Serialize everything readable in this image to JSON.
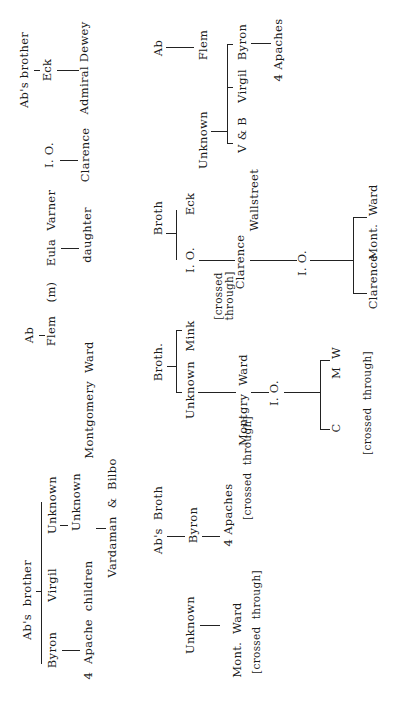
{
  "diagram": {
    "orientation": "page rotated 90deg counter-clockwise; text reads bottom-to-top",
    "type": "genealogy-tree",
    "labels": [
      {
        "id": "abs-brother-top",
        "text": "Ab's brother",
        "x": 25,
        "y": 70
      },
      {
        "id": "eck-top",
        "text": "Eck",
        "x": 48,
        "y": 70
      },
      {
        "id": "admiral-dewey",
        "text": "Admiral Dewey",
        "x": 85,
        "y": 68
      },
      {
        "id": "io-top",
        "text": "I. O.",
        "x": 50,
        "y": 155
      },
      {
        "id": "clarence-top",
        "text": "Clarence",
        "x": 86,
        "y": 155
      },
      {
        "id": "ab-top",
        "text": "Ab",
        "x": 159,
        "y": 48
      },
      {
        "id": "flem-top",
        "text": "Flem",
        "x": 204,
        "y": 45
      },
      {
        "id": "byron-top",
        "text": "Byron",
        "x": 243,
        "y": 42
      },
      {
        "id": "four-apaches-top",
        "text": "4 Apaches",
        "x": 279,
        "y": 50
      },
      {
        "id": "virgil-top",
        "text": "Virgil",
        "x": 243,
        "y": 86
      },
      {
        "id": "unknown-top",
        "text": "Unknown",
        "x": 204,
        "y": 140
      },
      {
        "id": "v-and-b",
        "text": "V & B",
        "x": 243,
        "y": 135
      },
      {
        "id": "wallstreet",
        "text": "Wallstreet",
        "x": 255,
        "y": 200
      },
      {
        "id": "eula-varner",
        "text": "Eula  Varner",
        "x": 52,
        "y": 228
      },
      {
        "id": "m-marker",
        "text": "(m)",
        "x": 52,
        "y": 292
      },
      {
        "id": "daughter",
        "text": "daughter",
        "x": 88,
        "y": 235
      },
      {
        "id": "broth-1",
        "text": "Broth",
        "x": 159,
        "y": 218
      },
      {
        "id": "eck-mid",
        "text": "Eck",
        "x": 191,
        "y": 204
      },
      {
        "id": "io-mid",
        "text": "I. O.",
        "x": 191,
        "y": 260
      },
      {
        "id": "crossed-through-1",
        "text": "[crossed\nthrough]",
        "x": 223,
        "y": 296
      },
      {
        "id": "clarence-mid",
        "text": "Clarence",
        "x": 241,
        "y": 262
      },
      {
        "id": "io-right",
        "text": "I. O.",
        "x": 303,
        "y": 263
      },
      {
        "id": "mont-ward-right",
        "text": "Mont.  Ward",
        "x": 374,
        "y": 222
      },
      {
        "id": "clarence-right",
        "text": "Clarence",
        "x": 374,
        "y": 282
      },
      {
        "id": "ab-left",
        "text": "Ab",
        "x": 30,
        "y": 335
      },
      {
        "id": "flem-left",
        "text": "Flem",
        "x": 52,
        "y": 331
      },
      {
        "id": "montgomery-ward",
        "text": "Montgomery  Ward",
        "x": 90,
        "y": 400
      },
      {
        "id": "broth-2",
        "text": "Broth.",
        "x": 159,
        "y": 362
      },
      {
        "id": "mink",
        "text": "Mink",
        "x": 191,
        "y": 336
      },
      {
        "id": "unknown-mid",
        "text": "Unknown",
        "x": 191,
        "y": 390
      },
      {
        "id": "montgry-ward",
        "text": "Montgry  Ward",
        "x": 244,
        "y": 400
      },
      {
        "id": "io-low",
        "text": "I. O.",
        "x": 275,
        "y": 393
      },
      {
        "id": "m-w",
        "text": "M  W",
        "x": 337,
        "y": 363
      },
      {
        "id": "c-label",
        "text": "C",
        "x": 337,
        "y": 428
      },
      {
        "id": "crossed-through-2",
        "text": "[crossed  through]",
        "x": 367,
        "y": 403
      },
      {
        "id": "abs-brother-left",
        "text": "Ab's  brother",
        "x": 28,
        "y": 600
      },
      {
        "id": "unknown-left-1",
        "text": "Unknown",
        "x": 53,
        "y": 505
      },
      {
        "id": "unknown-left-2",
        "text": "Unknown",
        "x": 77,
        "y": 502
      },
      {
        "id": "vardaman-bilbo",
        "text": "Vardaman  &  Bilbo",
        "x": 113,
        "y": 518
      },
      {
        "id": "virgil-left",
        "text": "Virgil",
        "x": 53,
        "y": 585
      },
      {
        "id": "byron-left",
        "text": "Byron",
        "x": 53,
        "y": 650
      },
      {
        "id": "four-apache-children",
        "text": "4  Apache  children",
        "x": 89,
        "y": 620
      },
      {
        "id": "abs-broth",
        "text": "Ab's  Broth",
        "x": 159,
        "y": 520
      },
      {
        "id": "byron-mid",
        "text": "Byron",
        "x": 194,
        "y": 525
      },
      {
        "id": "four-apaches-mid",
        "text": "4 Apaches",
        "x": 229,
        "y": 515
      },
      {
        "id": "crossed-through-3",
        "text": "[crossed  through]",
        "x": 247,
        "y": 468
      },
      {
        "id": "unknown-bottom",
        "text": "Unknown",
        "x": 191,
        "y": 625
      },
      {
        "id": "mont-ward-bottom",
        "text": "Mont.  Ward",
        "x": 238,
        "y": 640
      },
      {
        "id": "crossed-through-4",
        "text": "[crossed  through]",
        "x": 256,
        "y": 622
      }
    ]
  }
}
